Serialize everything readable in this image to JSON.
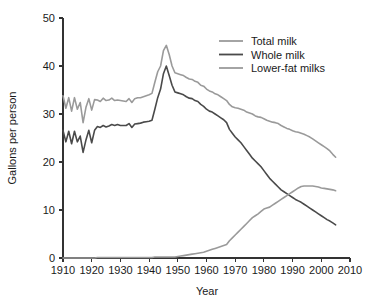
{
  "chart_data": {
    "type": "line",
    "title": "",
    "xlabel": "Year",
    "ylabel": "Gallons per person",
    "xlim": [
      1910,
      2010
    ],
    "ylim": [
      0,
      50
    ],
    "xticks": [
      1910,
      1920,
      1930,
      1940,
      1950,
      1960,
      1970,
      1980,
      1990,
      2000,
      2010
    ],
    "yticks": [
      0,
      10,
      20,
      30,
      40,
      50
    ],
    "grid": false,
    "legend_position": "top-right",
    "colors": {
      "total_milk": "#9a9a9a",
      "whole_milk": "#4a4a4a",
      "lower_fat_milks": "#9a9a9a",
      "axis": "#333333",
      "text": "#1a1a1a",
      "background": "#ffffff"
    },
    "x": [
      1910,
      1911,
      1912,
      1913,
      1914,
      1915,
      1916,
      1917,
      1918,
      1919,
      1920,
      1921,
      1922,
      1923,
      1924,
      1925,
      1926,
      1927,
      1928,
      1929,
      1930,
      1931,
      1932,
      1933,
      1934,
      1935,
      1936,
      1937,
      1938,
      1939,
      1940,
      1941,
      1942,
      1943,
      1944,
      1945,
      1946,
      1947,
      1948,
      1949,
      1950,
      1951,
      1952,
      1953,
      1954,
      1955,
      1956,
      1957,
      1958,
      1959,
      1960,
      1961,
      1962,
      1963,
      1964,
      1965,
      1966,
      1967,
      1968,
      1969,
      1970,
      1971,
      1972,
      1973,
      1974,
      1975,
      1976,
      1977,
      1978,
      1979,
      1980,
      1981,
      1982,
      1983,
      1984,
      1985,
      1986,
      1987,
      1988,
      1989,
      1990,
      1991,
      1992,
      1993,
      1994,
      1995,
      1996,
      1997,
      1998,
      1999,
      2000,
      2001,
      2002,
      2003,
      2004,
      2005
    ],
    "series": [
      {
        "name": "Total milk",
        "color": "#9a9a9a",
        "values": [
          33.8,
          31.2,
          33.4,
          30.6,
          33.4,
          31.0,
          32.4,
          28.2,
          31.4,
          33.2,
          30.8,
          33.0,
          32.9,
          32.6,
          33.3,
          32.8,
          32.9,
          33.3,
          32.8,
          32.9,
          32.8,
          32.7,
          32.6,
          33.2,
          32.4,
          33.2,
          33.4,
          33.4,
          33.6,
          33.8,
          34.0,
          34.3,
          36.6,
          38.8,
          40.0,
          43.2,
          44.3,
          42.4,
          40.0,
          38.6,
          38.4,
          38.2,
          38.0,
          37.6,
          37.3,
          37.2,
          36.8,
          36.6,
          36.0,
          35.8,
          35.2,
          34.8,
          34.6,
          34.2,
          34.0,
          33.6,
          33.2,
          32.8,
          32.0,
          31.5,
          31.3,
          31.2,
          31.0,
          30.8,
          30.4,
          30.2,
          30.0,
          29.6,
          29.4,
          29.3,
          29.0,
          28.7,
          28.5,
          28.3,
          28.2,
          28.0,
          27.6,
          27.3,
          27.0,
          26.8,
          26.5,
          26.3,
          26.2,
          26.0,
          25.8,
          25.5,
          25.2,
          24.8,
          24.4,
          24.0,
          23.6,
          23.2,
          22.8,
          22.3,
          21.6,
          21.0
        ]
      },
      {
        "name": "Whole milk",
        "color": "#4a4a4a",
        "values": [
          26.6,
          24.2,
          26.4,
          23.8,
          26.4,
          24.2,
          25.4,
          22.0,
          24.6,
          26.6,
          24.0,
          26.6,
          27.4,
          27.2,
          27.6,
          27.3,
          27.5,
          27.8,
          27.6,
          27.8,
          27.6,
          27.6,
          27.6,
          28.0,
          27.2,
          27.9,
          28.0,
          28.1,
          28.3,
          28.4,
          28.5,
          28.7,
          31.0,
          33.4,
          35.2,
          38.4,
          40.0,
          38.0,
          36.0,
          34.6,
          34.4,
          34.2,
          34.0,
          33.6,
          33.3,
          33.2,
          32.8,
          32.6,
          32.0,
          31.6,
          31.0,
          30.6,
          30.4,
          30.0,
          29.6,
          29.2,
          28.8,
          28.2,
          26.8,
          26.0,
          25.2,
          24.6,
          24.0,
          23.2,
          22.4,
          21.6,
          20.8,
          20.2,
          19.6,
          19.0,
          18.2,
          17.4,
          16.6,
          16.0,
          15.4,
          14.8,
          14.2,
          13.8,
          13.4,
          13.0,
          12.6,
          12.2,
          11.9,
          11.6,
          11.2,
          10.8,
          10.4,
          10.0,
          9.6,
          9.2,
          8.8,
          8.4,
          8.0,
          7.7,
          7.3,
          6.9
        ]
      },
      {
        "name": "Lower-fat milks",
        "color": "#9a9a9a",
        "values": [
          0.0,
          0.0,
          0.0,
          0.0,
          0.0,
          0.0,
          0.0,
          0.0,
          0.0,
          0.0,
          0.0,
          0.0,
          0.1,
          0.1,
          0.1,
          0.1,
          0.1,
          0.1,
          0.1,
          0.1,
          0.1,
          0.1,
          0.1,
          0.1,
          0.1,
          0.1,
          0.1,
          0.1,
          0.1,
          0.1,
          0.1,
          0.1,
          0.2,
          0.2,
          0.2,
          0.2,
          0.2,
          0.2,
          0.2,
          0.2,
          0.3,
          0.4,
          0.5,
          0.6,
          0.7,
          0.8,
          0.9,
          1.0,
          1.1,
          1.2,
          1.4,
          1.6,
          1.8,
          2.0,
          2.2,
          2.4,
          2.6,
          2.8,
          3.6,
          4.2,
          4.8,
          5.4,
          6.0,
          6.6,
          7.2,
          7.8,
          8.4,
          8.8,
          9.2,
          9.7,
          10.2,
          10.4,
          10.6,
          11.0,
          11.4,
          11.8,
          12.2,
          12.6,
          13.0,
          13.4,
          13.8,
          14.2,
          14.6,
          14.9,
          15.0,
          15.0,
          15.0,
          15.0,
          14.9,
          14.8,
          14.6,
          14.5,
          14.4,
          14.3,
          14.2,
          14.0
        ]
      }
    ]
  },
  "axes": {
    "ylabel": "Gallons per person",
    "xlabel": "Year",
    "ytick_labels": [
      "0",
      "10",
      "20",
      "30",
      "40",
      "50"
    ],
    "xtick_labels": [
      "1910",
      "1920",
      "1930",
      "1940",
      "1950",
      "1960",
      "1970",
      "1980",
      "1990",
      "2000",
      "2010"
    ]
  },
  "legend": {
    "items": [
      {
        "label": "Total milk",
        "color": "#9a9a9a"
      },
      {
        "label": "Whole milk",
        "color": "#4a4a4a"
      },
      {
        "label": "Lower-fat milks",
        "color": "#9a9a9a"
      }
    ]
  }
}
